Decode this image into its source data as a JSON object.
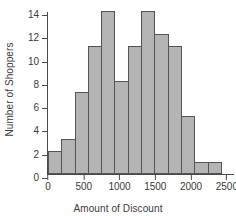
{
  "chart_data": {
    "type": "bar",
    "title": "",
    "xlabel": "Amount of Discount",
    "ylabel": "Number of Shoppers",
    "bin_width": 200,
    "bin_starts": [
      0,
      200,
      400,
      600,
      800,
      1000,
      1200,
      1400,
      1600,
      1800,
      2000,
      2200,
      2400
    ],
    "categories": [
      "0-200",
      "200-400",
      "400-600",
      "600-800",
      "800-1000",
      "1000-1200",
      "1200-1400",
      "1400-1600",
      "1600-1800",
      "1800-2000",
      "2000-2200",
      "2200-2400",
      "2400-2600"
    ],
    "values": [
      2,
      3,
      7,
      11,
      14,
      8,
      11,
      14,
      12,
      11,
      5,
      1,
      1
    ],
    "xlim": [
      0,
      2600
    ],
    "ylim": [
      0,
      14
    ],
    "xticks": [
      0,
      500,
      1000,
      1500,
      2000,
      2500
    ],
    "xtick_labels": [
      "0",
      "500",
      "1000",
      "1500",
      "2000",
      "2500"
    ],
    "yticks": [
      0,
      2,
      4,
      6,
      8,
      10,
      12,
      14
    ],
    "ytick_labels": [
      "0",
      "2",
      "4",
      "6",
      "8",
      "10",
      "12",
      "14"
    ],
    "grid": false,
    "legend": false,
    "bar_fill_color": "#b4b4b4",
    "bar_border_color": "#555555",
    "axis_color": "#4a4a4a",
    "text_color": "#3a3a3a",
    "background_color": "#ffffff"
  }
}
